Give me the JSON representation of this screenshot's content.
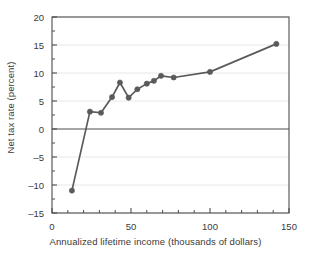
{
  "chart_data": {
    "type": "line",
    "title": "",
    "xlabel": "Annualized lifetime income (thousands of dollars)",
    "ylabel": "Net tax rate (percent)",
    "xlim": [
      0,
      150
    ],
    "ylim": [
      -15,
      20
    ],
    "xticks": [
      0,
      50,
      100,
      150
    ],
    "xtick_labels": [
      "0",
      "50",
      "100",
      "150"
    ],
    "xminor_ticks": [
      10,
      20,
      30,
      40,
      60,
      70,
      80,
      90,
      110,
      120,
      130,
      140
    ],
    "yticks": [
      -15,
      -10,
      -5,
      0,
      5,
      10,
      15,
      20
    ],
    "ytick_labels": [
      "–15",
      "–10",
      "–5",
      "0",
      "5",
      "10",
      "15",
      "20"
    ],
    "yminor_ticks": [
      -12.5,
      -7.5,
      -2.5,
      2.5,
      7.5,
      12.5,
      17.5
    ],
    "grid": "horizontal-major",
    "zero_line": 0,
    "marker": "circle",
    "series": [
      {
        "name": "Net tax rate",
        "color": "#5a5a5a",
        "x": [
          12.6,
          24.0,
          31.0,
          38.0,
          43.0,
          48.5,
          54.0,
          60.0,
          64.5,
          69.0,
          77.0,
          100.0,
          142.0
        ],
        "y": [
          -11.0,
          3.1,
          2.9,
          5.7,
          8.3,
          5.6,
          7.1,
          8.1,
          8.6,
          9.5,
          9.2,
          10.2,
          15.2
        ]
      }
    ]
  },
  "axis_style": {
    "line_color": "#4d4d4d",
    "grid_color": "#e8e8e8",
    "text_color": "#3a3a3a"
  }
}
